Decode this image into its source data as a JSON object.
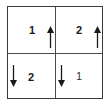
{
  "diagram": {
    "cells": [
      {
        "position": "top-left",
        "label": "1",
        "arrow": "up"
      },
      {
        "position": "top-right",
        "label": "2",
        "arrow": "up"
      },
      {
        "position": "bottom-left",
        "label": "2",
        "arrow": "down"
      },
      {
        "position": "bottom-right",
        "label": "1",
        "arrow": "down"
      }
    ],
    "colors": {
      "line": "#3a3a3a",
      "text": "#1a1a1a",
      "background": "#ffffff"
    }
  }
}
